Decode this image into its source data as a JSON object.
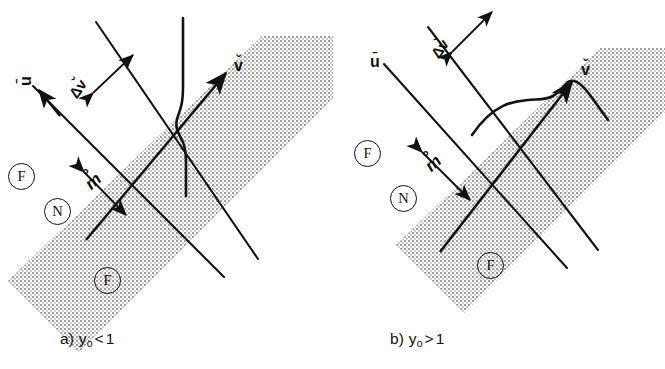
{
  "figure": {
    "background_color": "#ffffff",
    "ink_color": "#121212",
    "band_fill_color": "#b9b9b9",
    "band_description": "stippled grey band inclined at about 45 degrees running from lower-left to upper-right"
  },
  "panels": [
    {
      "id": "a",
      "caption": {
        "prefix": "a)",
        "symbol": "y",
        "subscript": "o",
        "relation": "<",
        "value": "1",
        "full_text": "a) yo < 1"
      },
      "labels": {
        "u_vector": "u",
        "u_accent": "ˉ",
        "v_vector": "v",
        "v_accent": "ˇ",
        "delta_v": "Δv",
        "delta_v_accent": "ˇ",
        "thickness": "m",
        "thickness_accent": "°",
        "region_left": "F",
        "region_band": "N",
        "region_bottom": "F"
      },
      "profile": "S-shaped velocity profile with the inflection inside the band; curve bulges toward the right (downstream) side"
    },
    {
      "id": "b",
      "caption": {
        "prefix": "b)",
        "symbol": "y",
        "subscript": "o",
        "relation": ">",
        "value": "1",
        "full_text": "b) yo > 1"
      },
      "labels": {
        "u_vector": "u",
        "u_accent": "ˉ",
        "v_vector": "v",
        "v_accent": "ˇ",
        "delta_v": "Δv",
        "delta_v_accent": "ˇ",
        "thickness": "m",
        "thickness_accent": "°",
        "region_left": "F",
        "region_band": "N",
        "region_bottom": "F"
      },
      "profile": "S-shaped velocity profile lying nearly along the band, flattened and shifted toward the upper-right"
    }
  ],
  "legend_notes": {
    "F": "fluid / flowing region",
    "N": "non-flowing (plug) region inside the band",
    "delta_v": "velocity jump across the shear band",
    "m": "band thickness measure"
  }
}
